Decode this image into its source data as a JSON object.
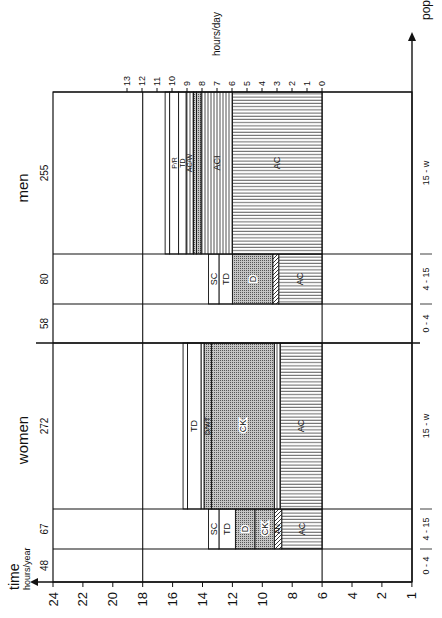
{
  "chart_data": {
    "type": "bar",
    "orientation": "rotated 90deg counter-clockwise (stacked horizontal bands drawn vertically in image)",
    "title": "",
    "xlabel": "pop. no.",
    "ylabel": "time hours/year",
    "ylabel_main": "time",
    "ylabel_sub": "hours/year",
    "secondary_axis_label": "hours/day",
    "time_axis_ticks": [
      "24",
      "22",
      "20",
      "18",
      "16",
      "14",
      "12",
      "10",
      "8",
      "6",
      "4",
      "2",
      "1"
    ],
    "hours_day_ticks": [
      "13",
      "12",
      "11",
      "10",
      "9",
      "8",
      "7",
      "6",
      "5",
      "4",
      "3",
      "2",
      "1",
      "0"
    ],
    "groups": [
      {
        "name": "women",
        "segments": [
          {
            "age": "0 - 4",
            "pop": 48,
            "activities": []
          },
          {
            "age": "4 - 15",
            "pop": 67,
            "activities": [
              {
                "code": "AC",
                "from": 6,
                "to": 8.7
              },
              {
                "code": "AN",
                "from": 8.7,
                "to": 9.2
              },
              {
                "code": "CK",
                "from": 9.2,
                "to": 10.5
              },
              {
                "code": "D",
                "from": 10.5,
                "to": 11.8
              },
              {
                "code": "TD",
                "from": 11.8,
                "to": 12.9
              },
              {
                "code": "SC",
                "from": 12.9,
                "to": 13.6
              }
            ]
          },
          {
            "age": "15 - w",
            "pop": 272,
            "activities": [
              {
                "code": "AC",
                "from": 6,
                "to": 8.8
              },
              {
                "code": "AC/W",
                "from": 8.8,
                "to": 9.2
              },
              {
                "code": "CK",
                "from": 9.2,
                "to": 13.4
              },
              {
                "code": "D/WT",
                "from": 13.4,
                "to": 13.9
              },
              {
                "code": "CC",
                "from": 13.9,
                "to": 14.1
              },
              {
                "code": "TD",
                "from": 14.1,
                "to": 15.0
              },
              {
                "code": "HY",
                "from": 15.0,
                "to": 15.3
              }
            ]
          }
        ]
      },
      {
        "name": "men",
        "segments": [
          {
            "age": "0 - 4",
            "pop": 58,
            "activities": []
          },
          {
            "age": "4 - 15",
            "pop": 80,
            "activities": [
              {
                "code": "AC",
                "from": 6,
                "to": 8.9
              },
              {
                "code": "AN",
                "from": 8.9,
                "to": 9.3
              },
              {
                "code": "D",
                "from": 9.3,
                "to": 12.0
              },
              {
                "code": "TD",
                "from": 12.0,
                "to": 12.9
              },
              {
                "code": "SC",
                "from": 12.9,
                "to": 13.6
              }
            ]
          },
          {
            "age": "15 - w",
            "pop": 255,
            "activities": [
              {
                "code": "AC",
                "from": 6,
                "to": 12
              },
              {
                "code": "ACI",
                "from": 12,
                "to": 14.1
              },
              {
                "code": "D",
                "from": 14.1,
                "to": 14.4
              },
              {
                "code": "D/W",
                "from": 14.4,
                "to": 14.6
              },
              {
                "code": "AC/W",
                "from": 14.6,
                "to": 15.1
              },
              {
                "code": "TD",
                "from": 15.1,
                "to": 15.6
              },
              {
                "code": "P/R",
                "from": 15.6,
                "to": 16.2
              },
              {
                "code": "HY",
                "from": 16.2,
                "to": 16.5
              }
            ]
          }
        ]
      }
    ],
    "reference_lines_hours": [
      18,
      6
    ],
    "grid": false,
    "legend": "none (labels inside bands)"
  },
  "labels": {
    "time": "time",
    "hours_year": "hours/year",
    "hours_day": "hours/day",
    "pop_no": "pop. no.",
    "women": "women",
    "men": "men"
  },
  "colors": {
    "ink": "#111111",
    "dotted_fill": "#b8b8b8",
    "background": "#ffffff"
  }
}
